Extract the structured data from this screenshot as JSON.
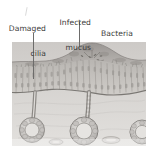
{
  "figure": {
    "domain_kind": "medical-illustration",
    "background_color": "#ffffff",
    "ink_color": "#3c3b3a",
    "leader_color": "#6d6c6b",
    "tissue_light": "#d8d6d4",
    "tissue_mid": "#b3b0ad",
    "tissue_dark": "#87847f",
    "mucus_color": "#9c9894"
  },
  "labels": [
    {
      "id": "damaged-cilia",
      "line1": "Damaged",
      "line2": "cilia",
      "align": "right"
    },
    {
      "id": "infected-mucus",
      "line1": "Infected",
      "line2": "mucus",
      "align": "right"
    },
    {
      "id": "bacteria",
      "line1": "Bacteria",
      "line2": "",
      "align": "left"
    }
  ],
  "leaders": [
    {
      "id": "leader-damaged-cilia",
      "x1": 33,
      "y1": 33,
      "x2": 33,
      "y2": 79
    },
    {
      "id": "leader-infected-mucus",
      "x1": 79,
      "y1": 22,
      "x2": 79,
      "y2": 46
    },
    {
      "id": "leader-bacteria",
      "x1": 103,
      "y1": 26,
      "x2": 97,
      "y2": 58
    }
  ],
  "illustration": {
    "title": "airway-epithelium-cross-section",
    "bounds": {
      "x": 12,
      "y": 42,
      "w": 134,
      "h": 104
    },
    "parts": [
      "mucus-mound",
      "cilia-layer",
      "columnar-epithelial-cells",
      "basement-membrane",
      "submucosal-gland-duct-left",
      "submucosal-gland-duct-center",
      "gland-acinus-left",
      "gland-acinus-center",
      "gland-acinus-right",
      "bacteria-cluster"
    ]
  }
}
